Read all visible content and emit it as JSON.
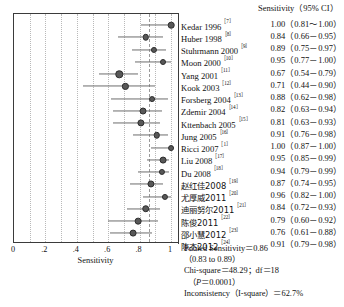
{
  "figure": {
    "type": "forest-plot",
    "column_header": "Sensitivity（95% CI）",
    "x_axis_title": "Sensitivity"
  },
  "axis": {
    "min": 0,
    "max": 1,
    "ticks": [
      {
        "value": 0,
        "label": "0"
      },
      {
        "value": 0.2,
        "label": ".2"
      },
      {
        "value": 0.4,
        "label": ".4"
      },
      {
        "value": 0.6,
        "label": ".6"
      },
      {
        "value": 0.8,
        "label": ".8"
      },
      {
        "value": 1.0,
        "label": "1"
      }
    ],
    "gridlines": [
      0.1,
      0.2,
      0.3,
      0.4,
      0.5,
      0.6,
      0.7,
      0.8,
      0.9,
      1.0
    ],
    "reference_line": 0.86
  },
  "chart_data": {
    "type": "forest",
    "title": "",
    "xlabel": "Sensitivity",
    "ylabel": "",
    "xlim": [
      0,
      1
    ],
    "grid": true,
    "legend": "none",
    "effect_measure": "Sensitivity",
    "ci_level": "95%",
    "studies": [
      {
        "name": "Kedar 1996",
        "ref": "［7］",
        "cn": false,
        "est": 1.0,
        "lo": 0.81,
        "hi": 1.0,
        "value_text": "1.00（0.81～1.00）",
        "weight": 1.0
      },
      {
        "name": "Huber 1998",
        "ref": "［8］",
        "cn": false,
        "est": 0.84,
        "lo": 0.66,
        "hi": 0.95,
        "value_text": "0.84（0.66－0.95）",
        "weight": 0.95
      },
      {
        "name": "Stuhrmann 2000",
        "ref": "［9］",
        "cn": false,
        "est": 0.89,
        "lo": 0.75,
        "hi": 0.97,
        "value_text": "0.89（0.75－0.97）",
        "weight": 0.8
      },
      {
        "name": "Moon 2000",
        "ref": "［10］",
        "cn": false,
        "est": 0.95,
        "lo": 0.77,
        "hi": 1.0,
        "value_text": "0.95（0.77－1.00）",
        "weight": 0.75
      },
      {
        "name": "Yang 2001",
        "ref": "［11］",
        "cn": false,
        "est": 0.67,
        "lo": 0.54,
        "hi": 0.79,
        "value_text": "0.67（0.54－0.79）",
        "weight": 1.35
      },
      {
        "name": "Kook 2003",
        "ref": "［12］",
        "cn": false,
        "est": 0.71,
        "lo": 0.44,
        "hi": 0.9,
        "value_text": "0.71（0.44－0.90）",
        "weight": 0.85
      },
      {
        "name": "Forsberg 2004",
        "ref": "［13］",
        "cn": false,
        "est": 0.88,
        "lo": 0.62,
        "hi": 0.98,
        "value_text": "0.88（0.62－0.98）",
        "weight": 0.7
      },
      {
        "name": "Zdemir 2004",
        "ref": "［14］",
        "cn": false,
        "est": 0.82,
        "lo": 0.63,
        "hi": 0.94,
        "value_text": "0.82（0.63－0.94）",
        "weight": 1.15
      },
      {
        "name": "Kttenbach 2005",
        "ref": "［15］",
        "cn": false,
        "est": 0.81,
        "lo": 0.63,
        "hi": 0.93,
        "value_text": "0.81（0.63－0.93）",
        "weight": 1.25
      },
      {
        "name": "Jung 2005",
        "ref": "［16］",
        "cn": false,
        "est": 0.91,
        "lo": 0.76,
        "hi": 0.98,
        "value_text": "0.91（0.76－0.98）",
        "weight": 0.95
      },
      {
        "name": "Ricci 2007",
        "ref": "［1］",
        "cn": false,
        "est": 1.0,
        "lo": 0.87,
        "hi": 1.0,
        "value_text": "1.00（0.87－1.00）",
        "weight": 0.7
      },
      {
        "name": "Liu 2008",
        "ref": "［17］",
        "cn": false,
        "est": 0.95,
        "lo": 0.85,
        "hi": 0.99,
        "value_text": "0.95（0.85－0.99）",
        "weight": 1.1
      },
      {
        "name": "Du 2008",
        "ref": "［18］",
        "cn": false,
        "est": 0.94,
        "lo": 0.79,
        "hi": 0.99,
        "value_text": "0.94（0.79－0.99）",
        "weight": 0.8
      },
      {
        "name": "赵红佳2008",
        "ref": "［19］",
        "cn": true,
        "est": 0.87,
        "lo": 0.74,
        "hi": 0.95,
        "value_text": "0.87（0.74－0.95）",
        "weight": 1.2
      },
      {
        "name": "尤厚威2011",
        "ref": "［20］",
        "cn": true,
        "est": 0.96,
        "lo": 0.82,
        "hi": 1.0,
        "value_text": "0.96（0.82－1.00）",
        "weight": 0.8
      },
      {
        "name": "迪丽努尔2011",
        "ref": "［21］",
        "cn": true,
        "est": 0.84,
        "lo": 0.72,
        "hi": 0.93,
        "value_text": "0.84（0.72－0.93）",
        "weight": 1.4
      },
      {
        "name": "陈俊2011",
        "ref": "［22］",
        "cn": true,
        "est": 0.79,
        "lo": 0.6,
        "hi": 0.92,
        "value_text": "0.79（0.60－0.92）",
        "weight": 1.05
      },
      {
        "name": "邵小慧2012",
        "ref": "［23］",
        "cn": true,
        "est": 0.76,
        "lo": 0.61,
        "hi": 0.88,
        "value_text": "0.76（0.61－0.88）",
        "weight": 1.1
      },
      {
        "name": "陈杰2012",
        "ref": "［24］",
        "cn": true,
        "est": 0.91,
        "lo": 0.79,
        "hi": 0.98,
        "value_text": "0.91（0.79－0.98）",
        "weight": 0.85
      }
    ],
    "pooled": {
      "est": 0.86,
      "lo": 0.83,
      "hi": 0.89,
      "label_line1": "Pooled Sensitivity＝0.86",
      "label_line2": "（0.83 to 0.89）"
    }
  },
  "stats": {
    "pooled_line1": "Pooled Sensitivity＝0.86",
    "pooled_line2": "（0.83 to 0.89）",
    "chi_square": "Chi-square＝48.29；df＝18",
    "p_value_prefix": "（",
    "p_italic": "P",
    "p_value_rest": "＝0.0001）",
    "inconsistency": "Inconsistency（I-square）＝62.7%"
  }
}
